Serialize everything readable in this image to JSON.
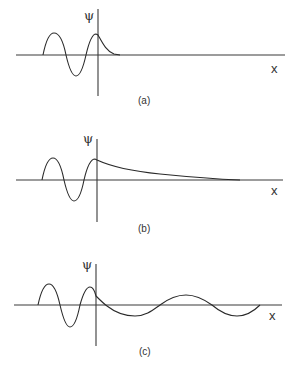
{
  "figure": {
    "panels": [
      {
        "id": "a",
        "caption": "(a)",
        "y_label": "ψ",
        "x_label": "x",
        "description": "Oscillating wave on left decaying rapidly to zero right of barrier"
      },
      {
        "id": "b",
        "caption": "(b)",
        "y_label": "ψ",
        "x_label": "x",
        "description": "Oscillating wave on left with slow exponential decay right of barrier"
      },
      {
        "id": "c",
        "caption": "(c)",
        "y_label": "ψ",
        "x_label": "x",
        "description": "Oscillating wave on left, lower-amplitude longer-wavelength oscillation right of barrier"
      }
    ],
    "colors": {
      "line": "#2a2a2a",
      "background": "#ffffff"
    }
  }
}
